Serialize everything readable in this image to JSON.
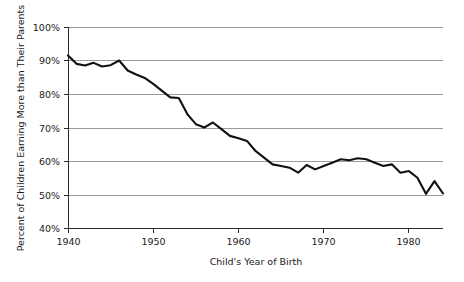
{
  "chart_data": {
    "type": "line",
    "title": "",
    "xlabel": "Child's Year of Birth",
    "ylabel": "Percent of Children Earning More than Their Parents",
    "xlim": [
      1940,
      1984
    ],
    "ylim": [
      40,
      100
    ],
    "grid": true,
    "legend": "none",
    "xticks": [
      1940,
      1950,
      1960,
      1970,
      1980
    ],
    "xtick_labels": [
      "1940",
      "1950",
      "1960",
      "1970",
      "1980"
    ],
    "yticks": [
      40,
      50,
      60,
      70,
      80,
      90,
      100
    ],
    "ytick_labels": [
      "40%",
      "50%",
      "60%",
      "70%",
      "80%",
      "90%",
      "100%"
    ],
    "series": [
      {
        "name": "Absolute mobility",
        "color": "#111111",
        "x": [
          1940,
          1941,
          1942,
          1943,
          1944,
          1945,
          1946,
          1947,
          1948,
          1949,
          1950,
          1951,
          1952,
          1953,
          1954,
          1955,
          1956,
          1957,
          1958,
          1959,
          1960,
          1961,
          1962,
          1963,
          1964,
          1965,
          1966,
          1967,
          1968,
          1969,
          1970,
          1971,
          1972,
          1973,
          1974,
          1975,
          1976,
          1977,
          1978,
          1979,
          1980,
          1981,
          1982,
          1983,
          1984
        ],
        "values": [
          91.5,
          89.0,
          88.5,
          89.3,
          88.2,
          88.6,
          90.0,
          87.0,
          85.8,
          84.8,
          83.0,
          81.0,
          79.0,
          78.8,
          74.0,
          71.0,
          70.0,
          71.5,
          69.5,
          67.5,
          66.8,
          66.0,
          63.0,
          61.0,
          59.0,
          58.5,
          58.0,
          56.5,
          58.8,
          57.5,
          58.5,
          59.5,
          60.5,
          60.2,
          60.8,
          60.5,
          59.5,
          58.5,
          59.0,
          56.5,
          57.0,
          55.0,
          50.2,
          54.0,
          50.3
        ]
      }
    ]
  },
  "plot_geometry": {
    "left": 68,
    "right": 443,
    "top": 27,
    "bottom": 228
  }
}
